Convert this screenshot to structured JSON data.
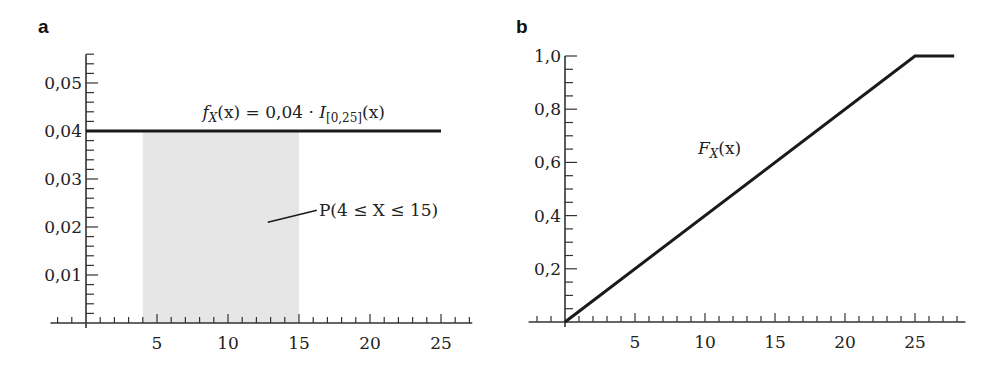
{
  "chart_data": [
    {
      "panel": "a",
      "type": "area",
      "title": "",
      "xlabel": "",
      "ylabel": "",
      "xlim": [
        -2.5,
        27.2
      ],
      "ylim": [
        0,
        0.056
      ],
      "x_ticks_major": [
        5,
        10,
        15,
        20,
        25
      ],
      "x_tick_labels": [
        "5",
        "10",
        "15",
        "20",
        "25"
      ],
      "y_ticks_major": [
        0.01,
        0.02,
        0.03,
        0.04,
        0.05
      ],
      "y_tick_labels": [
        "0,01",
        "0,02",
        "0,03",
        "0,04",
        "0,05"
      ],
      "grid": false,
      "series": [
        {
          "name": "f_X(x) = 0,04 · I_[0,25](x)",
          "type": "line",
          "x": [
            0,
            25
          ],
          "y": [
            0.04,
            0.04
          ]
        },
        {
          "name": "P(4 ≤ X ≤ 15)",
          "type": "shaded_area",
          "x": [
            4,
            15
          ],
          "y": [
            0.04,
            0.04
          ]
        }
      ],
      "annotations": [
        {
          "text_parts": [
            "f",
            "X",
            "(x) = 0,04 · ",
            "I",
            "[0,25]",
            "(x)"
          ],
          "x": 8.2,
          "y": 0.0415
        },
        {
          "text": "P(4 ≤ X ≤ 15)",
          "x": 16.4,
          "y": 0.0235,
          "leader_from": [
            12.8,
            0.021
          ]
        }
      ]
    },
    {
      "panel": "b",
      "type": "line",
      "title": "",
      "xlabel": "",
      "ylabel": "",
      "xlim": [
        -2.6,
        28.6
      ],
      "ylim": [
        0,
        1.0
      ],
      "x_ticks_major": [
        5,
        10,
        15,
        20,
        25
      ],
      "x_tick_labels": [
        "5",
        "10",
        "15",
        "20",
        "25"
      ],
      "y_ticks_major": [
        0.2,
        0.4,
        0.6,
        0.8,
        1.0
      ],
      "y_tick_labels": [
        "0,2",
        "0,4",
        "0,6",
        "0,8",
        "1,0"
      ],
      "grid": false,
      "series": [
        {
          "name": "F_X(x)",
          "x": [
            0,
            25,
            27.8
          ],
          "y": [
            0,
            1.0,
            1.0
          ]
        }
      ],
      "annotations": [
        {
          "text_parts": [
            "F",
            "X",
            "(x)"
          ],
          "x": 9.5,
          "y": 0.63
        }
      ]
    }
  ],
  "labels": {
    "panel_a": "a",
    "panel_b": "b",
    "pdf_label_f": "f",
    "pdf_label_sub": "X",
    "pdf_label_mid": "(x) = 0,04 · ",
    "pdf_label_I": "I",
    "pdf_label_Isub": "[0,25]",
    "pdf_label_end": "(x)",
    "prob_label": "P(4 ≤ X ≤ 15)",
    "cdf_label_F": "F",
    "cdf_label_sub": "X",
    "cdf_label_end": "(x)"
  },
  "colors": {
    "line": "#1a1a1a",
    "axis": "#333333",
    "shade": "#e6e6e6",
    "text": "#222222"
  }
}
